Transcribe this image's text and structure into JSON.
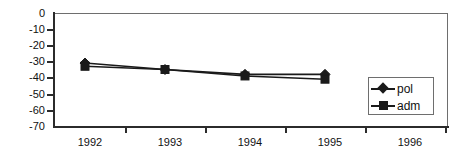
{
  "chart_data": {
    "type": "line",
    "title": "",
    "xlabel": "",
    "ylabel": "",
    "x": [
      1992,
      1993,
      1994,
      1995,
      1996
    ],
    "categories": [
      "1992",
      "1993",
      "1994",
      "1995",
      "1996"
    ],
    "series": [
      {
        "name": "pol",
        "marker": "diamond",
        "values": [
          -31,
          -35,
          -38,
          -38,
          null
        ]
      },
      {
        "name": "adm",
        "marker": "square",
        "values": [
          -33,
          -35,
          -39,
          -41,
          null
        ]
      }
    ],
    "ylim": [
      -70,
      0
    ],
    "yticks": [
      0,
      -10,
      -20,
      -30,
      -40,
      -50,
      -60,
      -70
    ],
    "ytick_labels": [
      "0",
      "-10",
      "-20",
      "-30",
      "-40",
      "-50",
      "-60",
      "-70"
    ],
    "xtick_labels": [
      "1992",
      "1993",
      "1994",
      "1995",
      "1996"
    ],
    "grid": false,
    "legend_position": "inside-right-lower",
    "line_color": "#1a1a1a",
    "frame_color": "#6e6e6e",
    "background": "#ffffff"
  },
  "legend": {
    "entries": [
      {
        "label": "pol",
        "marker": "diamond-marker-icon"
      },
      {
        "label": "adm",
        "marker": "square-marker-icon"
      }
    ]
  }
}
